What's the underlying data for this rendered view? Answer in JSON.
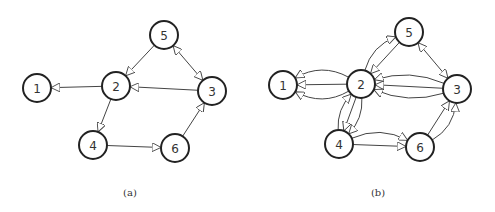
{
  "panels": [
    {
      "caption": "(a)",
      "nodes": [
        {
          "id": "1",
          "label": "1",
          "x": 37,
          "y": 88
        },
        {
          "id": "2",
          "label": "2",
          "x": 116,
          "y": 86
        },
        {
          "id": "3",
          "label": "3",
          "x": 212,
          "y": 91
        },
        {
          "id": "4",
          "label": "4",
          "x": 93,
          "y": 145
        },
        {
          "id": "5",
          "label": "5",
          "x": 164,
          "y": 35
        },
        {
          "id": "6",
          "label": "6",
          "x": 175,
          "y": 148
        }
      ],
      "edges": [
        {
          "from": "2",
          "to": "1"
        },
        {
          "from": "5",
          "to": "2"
        },
        {
          "from": "3",
          "to": "2"
        },
        {
          "from": "2",
          "to": "4"
        },
        {
          "from": "4",
          "to": "6"
        },
        {
          "from": "6",
          "to": "3"
        },
        {
          "from": "5",
          "to": "3",
          "bidirectional": true
        }
      ]
    },
    {
      "caption": "(b)",
      "nodes": [
        {
          "id": "1",
          "label": "1",
          "x": 283,
          "y": 85
        },
        {
          "id": "2",
          "label": "2",
          "x": 361,
          "y": 84
        },
        {
          "id": "3",
          "label": "3",
          "x": 457,
          "y": 89
        },
        {
          "id": "4",
          "label": "4",
          "x": 339,
          "y": 144
        },
        {
          "id": "5",
          "label": "5",
          "x": 409,
          "y": 32
        },
        {
          "id": "6",
          "label": "6",
          "x": 420,
          "y": 147
        }
      ],
      "edges": [
        {
          "from": "2",
          "to": "1"
        },
        {
          "from": "2",
          "to": "1",
          "curve": -22
        },
        {
          "from": "2",
          "to": "1",
          "curve": 22
        },
        {
          "from": "5",
          "to": "2"
        },
        {
          "from": "2",
          "to": "5",
          "curve": -18
        },
        {
          "from": "3",
          "to": "2"
        },
        {
          "from": "3",
          "to": "2",
          "curve": 18
        },
        {
          "from": "3",
          "to": "2",
          "curve": -18
        },
        {
          "from": "2",
          "to": "4"
        },
        {
          "from": "2",
          "to": "4",
          "curve": -14
        },
        {
          "from": "4",
          "to": "2",
          "curve": -14
        },
        {
          "from": "4",
          "to": "6"
        },
        {
          "from": "4",
          "to": "6",
          "curve": -20
        },
        {
          "from": "6",
          "to": "3"
        },
        {
          "from": "6",
          "to": "3",
          "curve": 18
        },
        {
          "from": "5",
          "to": "3",
          "bidirectional": true
        }
      ]
    }
  ]
}
